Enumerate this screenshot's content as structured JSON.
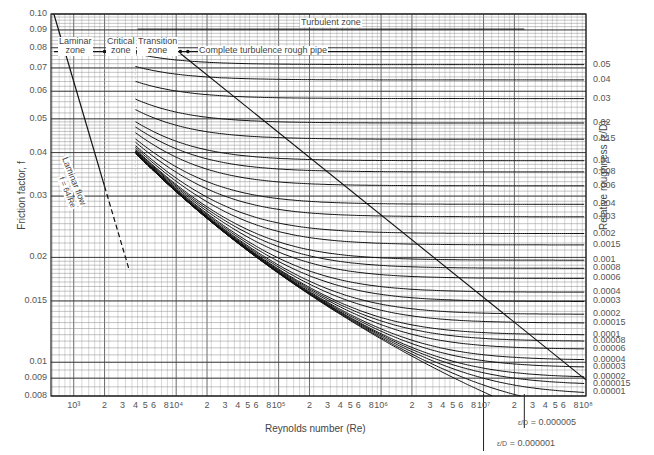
{
  "chart_data": {
    "type": "line",
    "xlabel": "Reynolds number (Re)",
    "ylabel": "Friction factor, f",
    "y2label": "Relative roughness (ε/D)",
    "xscale": "log",
    "yscale": "log",
    "xlim": [
      600,
      100000000
    ],
    "ylim": [
      0.008,
      0.1
    ],
    "grid": true,
    "x_tick_labels": [
      "10³",
      "2",
      "3",
      "4",
      "5",
      "6",
      "8",
      "10⁴",
      "2",
      "3",
      "4",
      "5",
      "6",
      "8",
      "10⁵",
      "2",
      "3",
      "4",
      "5",
      "6",
      "8",
      "10⁶",
      "2",
      "3",
      "4",
      "5",
      "6",
      "8",
      "10⁷",
      "2",
      "3",
      "4",
      "5",
      "6",
      "8",
      "10⁸"
    ],
    "x_tick_values": [
      1000,
      2000,
      3000,
      4000,
      5000,
      6000,
      8000,
      10000,
      20000,
      30000,
      40000,
      50000,
      60000,
      80000,
      100000,
      200000,
      300000,
      400000,
      500000,
      600000,
      800000,
      1000000,
      2000000,
      3000000,
      4000000,
      5000000,
      6000000,
      8000000,
      10000000,
      20000000,
      30000000,
      40000000,
      50000000,
      60000000,
      80000000,
      100000000
    ],
    "y_tick_labels": [
      "0.10",
      "0.09",
      "0.08",
      "0.07",
      "0.06",
      "0.05",
      "0.04",
      "0.03",
      "0.02",
      "0.015",
      "0.01",
      "0.009",
      "0.008"
    ],
    "y_tick_values": [
      0.1,
      0.09,
      0.08,
      0.07,
      0.06,
      0.05,
      0.04,
      0.03,
      0.02,
      0.015,
      0.01,
      0.009,
      0.008
    ],
    "relative_roughness_labels": [
      "0.05",
      "0.04",
      "0.03",
      "0.02",
      "0.015",
      "0.01",
      "0.008",
      "0.006",
      "0.004",
      "0.003",
      "0.002",
      "0.0015",
      "0.001",
      "0.0008",
      "0.0006",
      "0.0004",
      "0.0003",
      "0.0002",
      "0.00015",
      "0.0001",
      "0.00008",
      "0.00006",
      "0.00004",
      "0.00003",
      "0.00002",
      "0.000015",
      "0.00001"
    ],
    "relative_roughness_values": [
      0.05,
      0.04,
      0.03,
      0.02,
      0.015,
      0.01,
      0.008,
      0.006,
      0.004,
      0.003,
      0.002,
      0.0015,
      0.001,
      0.0008,
      0.0006,
      0.0004,
      0.0003,
      0.0002,
      0.00015,
      0.0001,
      8e-05,
      6e-05,
      4e-05,
      3e-05,
      2e-05,
      1.5e-05,
      1e-05,
      5e-06,
      1e-06
    ],
    "series": [
      {
        "name": "Laminar flow f = 64/Re",
        "x": [
          640,
          2000,
          3500
        ],
        "y": [
          0.1,
          0.032,
          0.0183
        ],
        "style": "solid then dashed beyond Re=2000"
      },
      {
        "name": "Complete turbulence boundary",
        "x": [
          11000,
          100000000
        ],
        "y": [
          0.077,
          0.0089
        ]
      }
    ],
    "annotations": [
      {
        "text": "Laminar zone",
        "x_range": [
          600,
          2000
        ]
      },
      {
        "text": "Critical zone",
        "x_range": [
          2000,
          4000
        ]
      },
      {
        "text": "Transition zone",
        "x_range": [
          4000,
          11000
        ]
      },
      {
        "text": "Turbulent zone",
        "x_range": [
          4000,
          100000000
        ]
      },
      {
        "text": "Complete turbulence rough pipe",
        "x_range": [
          11000,
          100000000
        ]
      },
      {
        "text": "Laminar flow",
        "rotated": true
      },
      {
        "text": "f = 64/Re",
        "rotated": true
      },
      {
        "text": "ε/D = 0.000001",
        "x": 10000000
      },
      {
        "text": "ε/D = 0.000005",
        "x": 25000000
      }
    ]
  },
  "axes": {
    "xlabel": "Reynolds number (Re)",
    "ylabel": "Friction factor, f",
    "y2label": "Relative roughness (ε/D)"
  },
  "zones": {
    "laminar": "Laminar\nzone",
    "critical": "Critical\nzone",
    "transition": "Transition\nzone",
    "turbulent": "Turbulent zone",
    "complete": "Complete turbulence rough pipe",
    "laminar_flow": "Laminar flow",
    "laminar_eq": "f = 64/Re"
  },
  "callouts": {
    "e1": "= 0.000001",
    "e5": "= 0.000005"
  }
}
